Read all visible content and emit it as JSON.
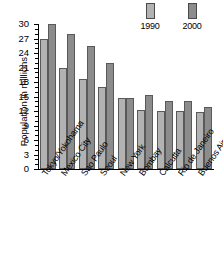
{
  "chart_data": {
    "type": "bar",
    "title": "",
    "subtitle": "",
    "xlabel": "",
    "ylabel": "Population in millions",
    "ylim": [
      0,
      30
    ],
    "ytick_step": 3,
    "yticks": [
      0,
      3,
      6,
      9,
      12,
      15,
      18,
      21,
      24,
      27,
      30
    ],
    "ytick_labels": [
      "0",
      "3",
      "6",
      "9",
      "12",
      "15",
      "18",
      "21",
      "24",
      "27",
      "30"
    ],
    "minor_tick_step": 1,
    "grid": false,
    "legend_position": "top-right",
    "categories": [
      "Tokyo/Yokohama",
      "Mexico City",
      "Sao Paulo",
      "Seoul",
      "New York",
      "Bombay",
      "Calcutta",
      "Rio de Janeiro",
      "Buenos Aires"
    ],
    "series": [
      {
        "name": "1990",
        "color": "#b2b2b2",
        "values": [
          27.0,
          20.9,
          18.7,
          17.0,
          14.6,
          12.2,
          12.1,
          12.0,
          11.8
        ]
      },
      {
        "name": "2000",
        "color": "#8c8c8c",
        "values": [
          30.0,
          27.9,
          25.4,
          22.0,
          14.6,
          15.4,
          14.1,
          14.1,
          12.9
        ]
      }
    ]
  },
  "legend": {
    "entries": [
      {
        "label": "1990",
        "color": "#b2b2b2"
      },
      {
        "label": "2000",
        "color": "#8c8c8c"
      }
    ]
  },
  "colors": {
    "bar_1990": "#b2b2b2",
    "bar_2000": "#8c8c8c",
    "bar_edge": "#595959",
    "axis": "#000000",
    "background": "#ffffff",
    "text": "#000000"
  }
}
